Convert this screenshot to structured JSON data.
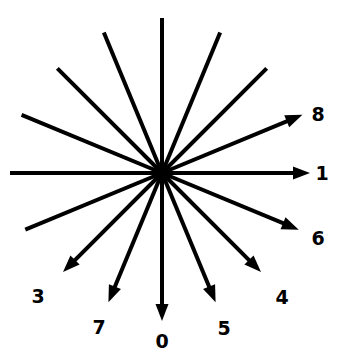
{
  "figure": {
    "type": "radial-direction-diagram",
    "title": "",
    "background_color": "#ffffff",
    "stroke_color": "#000000",
    "label_color": "#000000",
    "width": 345,
    "height": 363,
    "center": {
      "x": 162,
      "y": 173
    },
    "hub_radius": 9,
    "ray_count": 16,
    "angle_step_degrees": 22.5,
    "labeled_ray_count": 8,
    "label_font_size": 19,
    "label_font_weight": "bold"
  },
  "rays": [
    {
      "id": "ray-1",
      "label": "1",
      "has_label": true,
      "angle_degrees": 0,
      "compass": "east",
      "arrowhead": true,
      "line_length": 148,
      "label_x": 322,
      "label_y": 173
    },
    {
      "id": "ray-8",
      "label": "8",
      "has_label": true,
      "angle_degrees": 22.5,
      "compass": "east-northeast",
      "arrowhead": true,
      "line_length": 152,
      "label_x": 318,
      "label_y": 114
    },
    {
      "id": "ray-unlabeled-45",
      "label": "",
      "has_label": false,
      "angle_degrees": 45,
      "compass": "northeast",
      "arrowhead": false,
      "line_length": 148,
      "label_x": null,
      "label_y": null
    },
    {
      "id": "ray-unlabeled-67",
      "label": "",
      "has_label": false,
      "angle_degrees": 67.5,
      "compass": "north-northeast",
      "arrowhead": false,
      "line_length": 152,
      "label_x": null,
      "label_y": null
    },
    {
      "id": "ray-unlabeled-90",
      "label": "",
      "has_label": false,
      "angle_degrees": 90,
      "compass": "north",
      "arrowhead": false,
      "line_length": 155,
      "label_x": null,
      "label_y": null
    },
    {
      "id": "ray-unlabeled-112",
      "label": "",
      "has_label": false,
      "angle_degrees": 112.5,
      "compass": "north-northwest",
      "arrowhead": false,
      "line_length": 152,
      "label_x": null,
      "label_y": null
    },
    {
      "id": "ray-unlabeled-135",
      "label": "",
      "has_label": false,
      "angle_degrees": 135,
      "compass": "northwest",
      "arrowhead": false,
      "line_length": 148,
      "label_x": null,
      "label_y": null
    },
    {
      "id": "ray-unlabeled-157",
      "label": "",
      "has_label": false,
      "angle_degrees": 157.5,
      "compass": "west-northwest",
      "arrowhead": false,
      "line_length": 152,
      "label_x": null,
      "label_y": null
    },
    {
      "id": "ray-unlabeled-180",
      "label": "",
      "has_label": false,
      "angle_degrees": 180,
      "compass": "west",
      "arrowhead": false,
      "line_length": 152,
      "label_x": null,
      "label_y": null
    },
    {
      "id": "ray-unlabeled-202",
      "label": "",
      "has_label": false,
      "angle_degrees": 202.5,
      "compass": "west-southwest",
      "arrowhead": false,
      "line_length": 148,
      "label_x": null,
      "label_y": null
    },
    {
      "id": "ray-3",
      "label": "3",
      "has_label": true,
      "angle_degrees": 225,
      "compass": "southwest",
      "arrowhead": true,
      "line_length": 140,
      "label_x": 38,
      "label_y": 296
    },
    {
      "id": "ray-7",
      "label": "7",
      "has_label": true,
      "angle_degrees": 247.5,
      "compass": "south-southwest",
      "arrowhead": true,
      "line_length": 140,
      "label_x": 99,
      "label_y": 327
    },
    {
      "id": "ray-0",
      "label": "0",
      "has_label": true,
      "angle_degrees": 270,
      "compass": "south",
      "arrowhead": true,
      "line_length": 148,
      "label_x": 162,
      "label_y": 341
    },
    {
      "id": "ray-5",
      "label": "5",
      "has_label": true,
      "angle_degrees": 292.5,
      "compass": "south-southeast",
      "arrowhead": true,
      "line_length": 140,
      "label_x": 224,
      "label_y": 328
    },
    {
      "id": "ray-4",
      "label": "4",
      "has_label": true,
      "angle_degrees": 315,
      "compass": "southeast",
      "arrowhead": true,
      "line_length": 140,
      "label_x": 282,
      "label_y": 297
    },
    {
      "id": "ray-6",
      "label": "6",
      "has_label": true,
      "angle_degrees": 337.5,
      "compass": "east-southeast",
      "arrowhead": true,
      "line_length": 148,
      "label_x": 318,
      "label_y": 238
    }
  ]
}
